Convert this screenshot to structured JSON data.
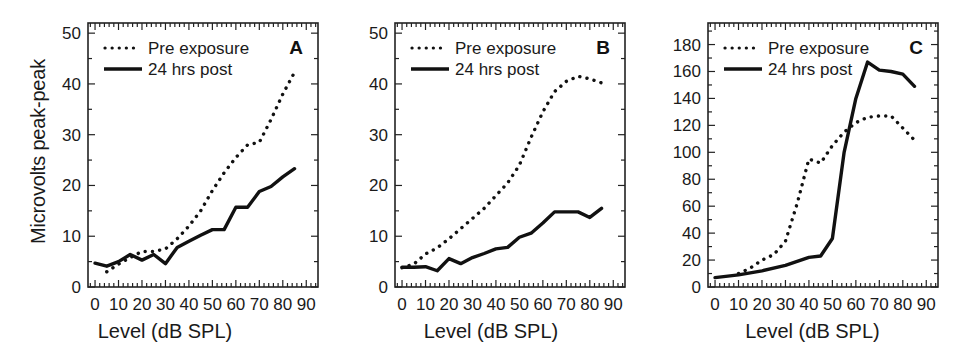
{
  "figure": {
    "ylabel": "Microvolts peak-peak",
    "xlabel": "Level (dB SPL)",
    "legend": {
      "pre_label": "Pre exposure",
      "post_label": "24 hrs post",
      "pre_style": "dotted",
      "post_style": "solid"
    },
    "line_color": "#111111",
    "background": "#ffffff"
  },
  "panels": [
    {
      "letter": "A",
      "xlabel": "Level (dB SPL)",
      "ylabel": "Microvolts peak-peak",
      "xticklabels": [
        "0",
        "10",
        "20",
        "30",
        "40",
        "50",
        "60",
        "70",
        "80",
        "90"
      ],
      "yticklabels": [
        "0",
        "10",
        "20",
        "30",
        "40",
        "50"
      ]
    },
    {
      "letter": "B",
      "xlabel": "Level (dB SPL)",
      "xticklabels": [
        "0",
        "10",
        "20",
        "30",
        "40",
        "50",
        "60",
        "70",
        "80",
        "90"
      ],
      "yticklabels": [
        "0",
        "10",
        "20",
        "30",
        "40",
        "50"
      ]
    },
    {
      "letter": "C",
      "xlabel": "Level (dB SPL)",
      "xticklabels": [
        "0",
        "10",
        "20",
        "30",
        "40",
        "50",
        "60",
        "70",
        "80",
        "90"
      ],
      "yticklabels": [
        "0",
        "20",
        "40",
        "60",
        "80",
        "100",
        "120",
        "140",
        "160",
        "180"
      ]
    }
  ],
  "chart_data": [
    {
      "type": "line",
      "panel": "A",
      "title": "A",
      "xlabel": "Level (dB SPL)",
      "ylabel": "Microvolts peak-peak",
      "xlim": [
        -3,
        95
      ],
      "ylim": [
        0,
        52
      ],
      "xticks": [
        0,
        10,
        20,
        30,
        40,
        50,
        60,
        70,
        80,
        90
      ],
      "yticks": [
        0,
        10,
        20,
        30,
        40,
        50
      ],
      "grid": false,
      "legend_position": "upper-left",
      "series": [
        {
          "name": "Pre exposure",
          "style": "dotted",
          "x": [
            5,
            10,
            15,
            20,
            25,
            30,
            35,
            40,
            45,
            50,
            55,
            60,
            65,
            70,
            75,
            80,
            85
          ],
          "values": [
            3.0,
            4.5,
            5.8,
            7.0,
            7.0,
            7.5,
            9.5,
            12.0,
            15.0,
            19.0,
            22.5,
            25.5,
            28.0,
            28.5,
            33.0,
            38.0,
            42.3
          ]
        },
        {
          "name": "24 hrs post",
          "style": "solid",
          "x": [
            0,
            5,
            10,
            15,
            20,
            25,
            30,
            35,
            40,
            45,
            50,
            55,
            60,
            65,
            70,
            75,
            80,
            85
          ],
          "values": [
            4.7,
            4.1,
            5.0,
            6.4,
            5.3,
            6.4,
            4.6,
            7.8,
            9.0,
            10.2,
            11.3,
            11.3,
            15.7,
            15.7,
            18.8,
            19.8,
            21.7,
            23.3
          ]
        }
      ]
    },
    {
      "type": "line",
      "panel": "B",
      "title": "B",
      "xlabel": "Level (dB SPL)",
      "ylabel": "Microvolts peak-peak",
      "xlim": [
        -3,
        95
      ],
      "ylim": [
        0,
        52
      ],
      "xticks": [
        0,
        10,
        20,
        30,
        40,
        50,
        60,
        70,
        80,
        90
      ],
      "yticks": [
        0,
        10,
        20,
        30,
        40,
        50
      ],
      "grid": false,
      "legend_position": "upper-left",
      "series": [
        {
          "name": "Pre exposure",
          "style": "dotted",
          "x": [
            0,
            5,
            10,
            15,
            20,
            25,
            30,
            35,
            40,
            45,
            50,
            55,
            60,
            65,
            70,
            75,
            80,
            85
          ],
          "values": [
            3.8,
            4.5,
            6.5,
            7.7,
            9.5,
            11.5,
            13.5,
            15.5,
            18.0,
            20.5,
            24.0,
            29.5,
            34.5,
            38.5,
            40.5,
            41.5,
            41.0,
            40.2
          ]
        },
        {
          "name": "24 hrs post",
          "style": "solid",
          "x": [
            0,
            5,
            10,
            15,
            20,
            25,
            30,
            35,
            40,
            45,
            50,
            55,
            60,
            65,
            70,
            75,
            80,
            85
          ],
          "values": [
            3.9,
            3.9,
            4.0,
            3.2,
            5.6,
            4.6,
            5.8,
            6.6,
            7.5,
            7.8,
            9.8,
            10.6,
            12.6,
            14.8,
            14.8,
            14.8,
            13.7,
            15.5
          ]
        }
      ]
    },
    {
      "type": "line",
      "panel": "C",
      "title": "C",
      "xlabel": "Level (dB SPL)",
      "ylabel": "Microvolts peak-peak",
      "xlim": [
        -3,
        95
      ],
      "ylim": [
        0,
        196
      ],
      "xticks": [
        0,
        10,
        20,
        30,
        40,
        50,
        60,
        70,
        80,
        90
      ],
      "yticks": [
        0,
        20,
        40,
        60,
        80,
        100,
        120,
        140,
        160,
        180
      ],
      "grid": false,
      "legend_position": "upper-left",
      "series": [
        {
          "name": "Pre exposure",
          "style": "dotted",
          "x": [
            10,
            15,
            20,
            25,
            30,
            35,
            40,
            45,
            50,
            55,
            60,
            65,
            70,
            75,
            80,
            85
          ],
          "values": [
            10,
            14,
            20,
            24,
            34,
            62,
            95,
            92,
            105,
            115,
            122,
            126,
            127,
            127,
            118,
            109
          ]
        },
        {
          "name": "24 hrs post",
          "style": "solid",
          "x": [
            0,
            10,
            20,
            30,
            40,
            45,
            50,
            55,
            60,
            65,
            70,
            75,
            80,
            85
          ],
          "values": [
            7,
            9,
            12,
            16,
            22,
            23,
            36,
            100,
            140,
            167,
            161,
            160,
            158,
            149
          ]
        }
      ]
    }
  ]
}
